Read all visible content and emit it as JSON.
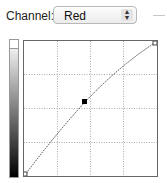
{
  "channel": {
    "label": "Channel:",
    "selected": "Red"
  },
  "curve": {
    "control_points": [
      {
        "input": 0,
        "output": 0
      },
      {
        "input": 45,
        "output": 55
      },
      {
        "input": 255,
        "output": 255
      }
    ]
  },
  "icons": {
    "stepper": "up-down-arrows-icon"
  }
}
